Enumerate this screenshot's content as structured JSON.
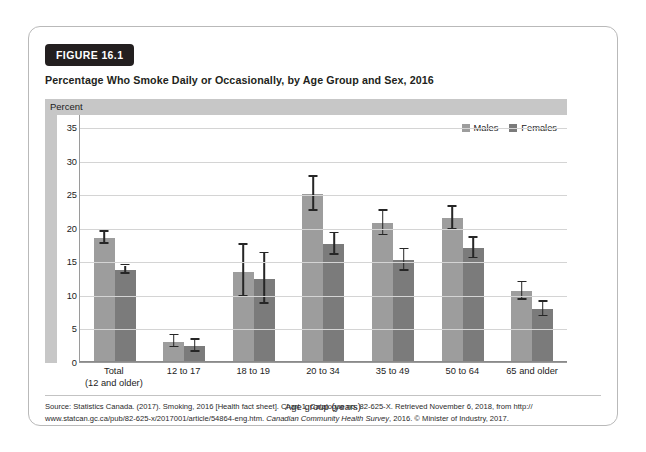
{
  "figure": {
    "badge": "FIGURE 16.1",
    "title": "Percentage Who Smoke Daily or Occasionally, by Age Group and Sex, 2016"
  },
  "colors": {
    "males": "#9d9d9d",
    "females": "#7b7b7b",
    "band": "#c7c7c7",
    "grid": "#d4d4d4",
    "error": "#262626",
    "badge_bg": "#231f20"
  },
  "source": {
    "line1": "Source: Statistics Canada. (2017). Smoking, 2016 [Health fact sheet]. Chart 1. Catalogue no. 82-625-X. Retrieved November 6, 2018, from http://",
    "line2_a": "www.statcan.gc.ca/pub/82-625-x/2017001/article/54864-eng.htm. ",
    "line2_italic": "Canadian Community Health Survey",
    "line2_b": ", 2016. © Minister of Industry, 2017."
  },
  "chart_data": {
    "type": "bar",
    "title": "Percentage Who Smoke Daily or Occasionally, by Age Group and Sex, 2016",
    "xlabel": "Age group (years)",
    "ylabel": "Percent",
    "ylim": [
      0,
      37
    ],
    "yticks": [
      0,
      5,
      10,
      15,
      20,
      25,
      30,
      35
    ],
    "grid": true,
    "legend_position": "top-right",
    "error_bars": "95% confidence interval",
    "categories": [
      "Total\n(12 and older)",
      "12 to 17",
      "18 to 19",
      "20 to 34",
      "35 to 49",
      "50 to 64",
      "65 and older"
    ],
    "category_labels": [
      {
        "main": "Total",
        "sub": "(12 and older)"
      },
      {
        "main": "12 to 17",
        "sub": ""
      },
      {
        "main": "18 to 19",
        "sub": ""
      },
      {
        "main": "20 to 34",
        "sub": ""
      },
      {
        "main": "35 to 49",
        "sub": ""
      },
      {
        "main": "50 to 64",
        "sub": ""
      },
      {
        "main": "65 and older",
        "sub": ""
      }
    ],
    "series": [
      {
        "name": "Males",
        "values": [
          18.5,
          3.0,
          13.5,
          25.1,
          20.7,
          21.5,
          10.6
        ],
        "err_low": [
          17.6,
          2.2,
          9.7,
          22.6,
          18.9,
          19.8,
          9.3
        ],
        "err_high": [
          19.4,
          4.0,
          17.5,
          27.6,
          22.6,
          23.2,
          11.9
        ]
      },
      {
        "name": "Females",
        "values": [
          13.8,
          2.4,
          12.4,
          17.6,
          15.2,
          17.0,
          7.9
        ],
        "err_low": [
          13.2,
          1.5,
          8.7,
          16.0,
          13.6,
          15.5,
          6.8
        ],
        "err_high": [
          14.4,
          3.3,
          16.2,
          19.2,
          16.8,
          18.5,
          9.0
        ]
      }
    ]
  }
}
